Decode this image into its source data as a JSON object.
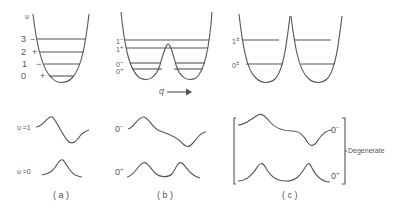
{
  "panel_a": {
    "axis_label": "υ",
    "levels": [
      {
        "num": "3",
        "sign": "−"
      },
      {
        "num": "2",
        "sign": "+"
      },
      {
        "num": "1",
        "sign": "−"
      },
      {
        "num": "0",
        "sign": "+"
      }
    ],
    "wavefunctions": [
      {
        "label": "υ =1"
      },
      {
        "label": "υ =0"
      }
    ],
    "caption": "( a )"
  },
  "panel_b": {
    "levels": [
      {
        "num": "1",
        "sign": "−"
      },
      {
        "num": "1",
        "sign": "+"
      },
      {
        "num": "0",
        "sign": "−"
      },
      {
        "num": "0",
        "sign": "+"
      }
    ],
    "coordinate_label": "q",
    "wavefunctions": [
      {
        "num": "0",
        "sign": "−"
      },
      {
        "num": "0",
        "sign": "+"
      }
    ],
    "caption": "( b )"
  },
  "panel_c": {
    "levels": [
      {
        "num": "1",
        "sign": "±"
      },
      {
        "num": "0",
        "sign": "±"
      }
    ],
    "wavefunctions": [
      {
        "num": "0",
        "sign": "−"
      },
      {
        "num": "0",
        "sign": "+"
      }
    ],
    "bracket_label": "Degenerate",
    "caption": "( c )"
  }
}
